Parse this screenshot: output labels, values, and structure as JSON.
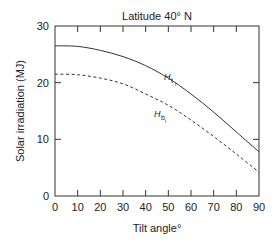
{
  "chart_data": {
    "type": "line",
    "title": "Latitude 40° N",
    "xlabel": "Tilt angle°",
    "ylabel": "Solar irradiation (MJ)",
    "xlim": [
      0,
      90
    ],
    "ylim": [
      0,
      30
    ],
    "x_ticks": [
      0,
      10,
      20,
      30,
      40,
      50,
      60,
      70,
      80,
      90
    ],
    "y_ticks": [
      0,
      10,
      20,
      30
    ],
    "grid": false,
    "x": [
      0,
      10,
      20,
      30,
      40,
      50,
      60,
      70,
      80,
      90
    ],
    "series": [
      {
        "name": "H_ti",
        "label_main": "H",
        "label_sub": "t",
        "label_subsub": "i",
        "style": "solid",
        "values": [
          26.5,
          26.4,
          25.7,
          24.6,
          23.0,
          20.8,
          18.0,
          14.8,
          11.3,
          7.8
        ]
      },
      {
        "name": "H_bi",
        "label_main": "H",
        "label_sub": "b",
        "label_subsub": "i",
        "style": "dashed",
        "values": [
          21.5,
          21.4,
          20.8,
          19.8,
          18.0,
          16.0,
          13.4,
          10.5,
          7.4,
          4.2
        ]
      }
    ],
    "colors": {
      "line": "#333333",
      "axis": "#333333"
    }
  }
}
